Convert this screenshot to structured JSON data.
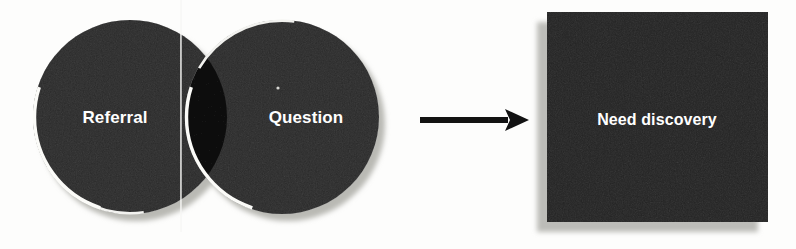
{
  "diagram": {
    "type": "venn-to-outcome",
    "background_color": "#fdfdfc",
    "venn": {
      "left_circle": {
        "label": "Referral",
        "fill_color": "#6f6f6f",
        "cx": 130,
        "cy": 117,
        "r": 97
      },
      "right_circle": {
        "label": "Question",
        "fill_color": "#6f6f6f",
        "cx": 282,
        "cy": 117,
        "r": 97
      },
      "overlap": {
        "fill_color": "#3b3b3b",
        "outline_color": "#f2f2ef"
      },
      "shadow_color": "#b9b9b4"
    },
    "arrow": {
      "name": "leads-to-arrow",
      "color": "#121212",
      "x_start": 420,
      "x_end": 529,
      "y": 120
    },
    "result": {
      "label": "Need discovery",
      "fill_color": "#676767",
      "shadow_color": "#bcbcb8",
      "x": 547,
      "y": 12,
      "width": 221,
      "height": 210
    },
    "artifact": {
      "name": "scan-fold-line",
      "color": "#f6f6f3",
      "x": 181
    }
  }
}
